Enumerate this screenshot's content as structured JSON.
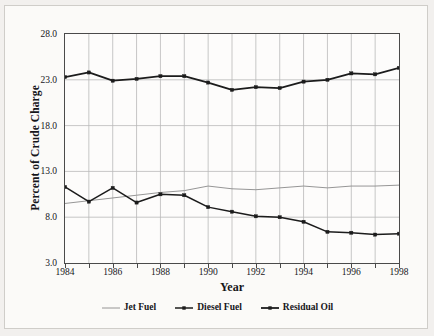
{
  "chart_data": {
    "type": "line",
    "title": "",
    "xlabel": "Year",
    "ylabel": "Percent of Crude Charge",
    "xlim": [
      1984,
      1998
    ],
    "ylim": [
      3.0,
      28.0
    ],
    "grid": true,
    "legend_position": "bottom",
    "x": [
      1984,
      1985,
      1986,
      1987,
      1988,
      1989,
      1990,
      1991,
      1992,
      1993,
      1994,
      1995,
      1996,
      1997,
      1998
    ],
    "xticks": [
      1984,
      1985,
      1986,
      1987,
      1988,
      1989,
      1990,
      1991,
      1992,
      1993,
      1994,
      1995,
      1996,
      1997,
      1998
    ],
    "xtick_labels": [
      "1984",
      "",
      "1986",
      "",
      "1988",
      "",
      "1990",
      "",
      "1992",
      "",
      "1994",
      "",
      "1996",
      "",
      "1998"
    ],
    "yticks": [
      3.0,
      8.0,
      13.0,
      18.0,
      23.0,
      28.0
    ],
    "ytick_labels": [
      "3.0",
      "8.0",
      "13.0",
      "18.0",
      "23.0",
      "28.0"
    ],
    "series": [
      {
        "name": "Jet Fuel",
        "color": "#8a8a8a",
        "marker": "none",
        "width": 0.9,
        "values": [
          9.5,
          9.8,
          10.1,
          10.4,
          10.7,
          10.9,
          11.4,
          11.1,
          11.0,
          11.2,
          11.4,
          11.2,
          11.4,
          11.4,
          11.5
        ]
      },
      {
        "name": "Diesel Fuel",
        "color": "#1c1c1c",
        "marker": "square",
        "width": 1.5,
        "values": [
          11.3,
          9.7,
          11.2,
          9.6,
          10.5,
          10.4,
          9.1,
          8.6,
          8.1,
          8.0,
          7.5,
          6.4,
          6.3,
          6.1,
          6.2
        ]
      },
      {
        "name": "Residual Oil",
        "color": "#1c1c1c",
        "marker": "square",
        "width": 1.8,
        "values": [
          23.3,
          23.8,
          22.9,
          23.1,
          23.4,
          23.4,
          22.7,
          21.9,
          22.2,
          22.1,
          22.8,
          23.0,
          23.7,
          23.6,
          24.3
        ]
      }
    ]
  }
}
